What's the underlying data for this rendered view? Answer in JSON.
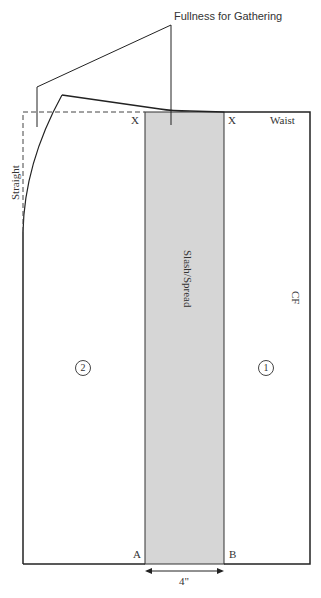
{
  "diagram": {
    "callout": "Fullness for Gathering",
    "labels": {
      "x_left": "X",
      "x_right": "X",
      "waist": "Waist",
      "straight": "Straight",
      "slash_spread": "Slash/Spread",
      "cf": "CF",
      "piece_1": "1",
      "piece_2": "2",
      "point_a": "A",
      "point_b": "B",
      "width": "4\""
    },
    "colors": {
      "line": "#222222",
      "strip_fill": "#d6d6d6"
    }
  }
}
